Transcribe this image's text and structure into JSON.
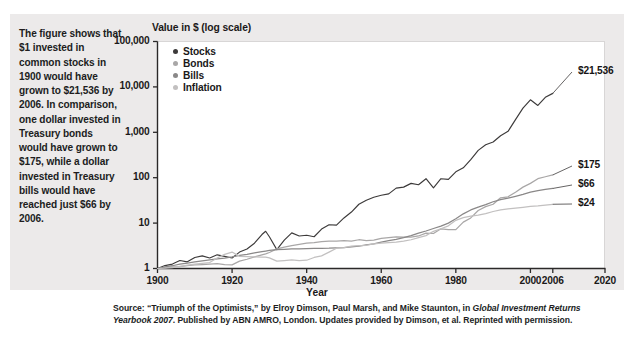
{
  "caption": "The figure shows that $1 invested in common stocks in 1900 would have grown to $21,536 by 2006. In comparison, one dollar invested in Treasury bonds would have grown to $175, while a dollar invested in Treasury bills would have reached just $66 by 2006.",
  "source": {
    "part1": "Source: “Triumph of the Optimists,” by Elroy Dimson, Paul Marsh, and Mike Staunton, in ",
    "italic1": "Global Investment Returns Yearbook 2007",
    "part2": ". Published by ABN AMRO, London. Updates provided by Dimson, et al. Reprinted with permission."
  },
  "chart_data": {
    "type": "line",
    "title": "",
    "ylabel": "Value in $ (log scale)",
    "xlabel": "Year",
    "yscale": "log",
    "ylim": [
      1,
      100000
    ],
    "xlim": [
      1900,
      2020
    ],
    "grid": false,
    "legend_position": "top-left inside plot",
    "ytick_labels": [
      "100,000",
      "10,000",
      "1,000",
      "100",
      "10",
      "1"
    ],
    "ytick_values": [
      100000,
      10000,
      1000,
      100,
      10,
      1
    ],
    "xtick_labels": [
      "1900",
      "1920",
      "1940",
      "1960",
      "1980",
      "2000",
      "2006",
      "2020"
    ],
    "xtick_values": [
      1900,
      1920,
      1940,
      1960,
      1980,
      2000,
      2006,
      2020
    ],
    "legend": [
      "Stocks",
      "Bonds",
      "Bills",
      "Inflation"
    ],
    "colors": {
      "stocks": "#3c3a3a",
      "bonds": "#a9a7a7",
      "bills": "#8a8888",
      "inflation": "#c2c0c0"
    },
    "end_labels": [
      {
        "series": "Stocks",
        "text": "$21,536",
        "value": 21536,
        "year": 2006
      },
      {
        "series": "Bonds",
        "text": "$175",
        "value": 175,
        "year": 2006
      },
      {
        "series": "Bills",
        "text": "$66",
        "value": 66,
        "year": 2006
      },
      {
        "series": "Inflation",
        "text": "$24",
        "value": 24,
        "year": 2006
      }
    ],
    "x": [
      1900,
      1902,
      1904,
      1906,
      1908,
      1910,
      1912,
      1914,
      1916,
      1918,
      1920,
      1922,
      1924,
      1926,
      1928,
      1929,
      1930,
      1932,
      1934,
      1936,
      1938,
      1940,
      1942,
      1944,
      1946,
      1948,
      1950,
      1952,
      1954,
      1956,
      1958,
      1960,
      1962,
      1964,
      1966,
      1968,
      1970,
      1972,
      1974,
      1976,
      1978,
      1980,
      1982,
      1984,
      1986,
      1988,
      1990,
      1992,
      1994,
      1996,
      1998,
      2000,
      2002,
      2004,
      2006
    ],
    "series": [
      {
        "name": "Stocks",
        "color": "#3c3a3a",
        "values": [
          1,
          1.16,
          1.25,
          1.5,
          1.4,
          1.75,
          1.9,
          1.7,
          2.0,
          1.85,
          1.7,
          2.3,
          2.7,
          3.6,
          5.6,
          6.6,
          5.0,
          2.6,
          4.2,
          6.1,
          5.2,
          5.4,
          5.0,
          7.4,
          9.2,
          9.0,
          13.0,
          17.5,
          26.0,
          32.0,
          37.0,
          41.0,
          44.0,
          59.0,
          62.0,
          75.0,
          70.0,
          95.0,
          60.0,
          95.0,
          92.0,
          135.0,
          165.0,
          250.0,
          400.0,
          530.0,
          610.0,
          840.0,
          1050.0,
          1900.0,
          3400.0,
          5200.0,
          3900.0,
          5900.0,
          7200.0
        ]
      },
      {
        "name": "Bonds",
        "color": "#a9a7a7",
        "values": [
          1,
          1.05,
          1.08,
          1.1,
          1.15,
          1.2,
          1.22,
          1.25,
          1.28,
          1.22,
          1.2,
          1.45,
          1.6,
          1.8,
          2.0,
          2.1,
          2.25,
          2.7,
          2.95,
          3.2,
          3.4,
          3.6,
          3.7,
          3.9,
          4.0,
          4.0,
          4.1,
          4.0,
          4.3,
          4.1,
          4.2,
          4.6,
          4.8,
          5.0,
          4.9,
          4.9,
          5.2,
          6.0,
          5.9,
          7.5,
          7.2,
          7.2,
          10.5,
          13.0,
          19.0,
          23.0,
          26.0,
          36.0,
          38.0,
          48.0,
          62.0,
          75.0,
          95.0,
          105.0,
          115.0
        ]
      },
      {
        "name": "Bills",
        "color": "#8a8888",
        "values": [
          1,
          1.08,
          1.15,
          1.25,
          1.32,
          1.4,
          1.48,
          1.55,
          1.62,
          1.7,
          1.8,
          1.95,
          2.05,
          2.2,
          2.35,
          2.42,
          2.5,
          2.6,
          2.65,
          2.7,
          2.72,
          2.74,
          2.76,
          2.78,
          2.8,
          2.85,
          2.9,
          3.0,
          3.1,
          3.3,
          3.5,
          3.8,
          4.1,
          4.4,
          4.8,
          5.3,
          6.0,
          6.7,
          7.6,
          8.6,
          10.0,
          12.5,
          16.0,
          19.5,
          22.5,
          25.5,
          29.5,
          33.0,
          35.5,
          39.0,
          43.0,
          48.0,
          52.0,
          55.0,
          58.0
        ]
      },
      {
        "name": "Inflation",
        "color": "#c2c0c0",
        "values": [
          1,
          1.02,
          1.05,
          1.12,
          1.18,
          1.25,
          1.3,
          1.35,
          1.7,
          2.05,
          2.3,
          1.85,
          1.82,
          1.8,
          1.78,
          1.78,
          1.72,
          1.45,
          1.5,
          1.55,
          1.5,
          1.52,
          1.75,
          1.9,
          2.3,
          2.8,
          2.9,
          3.1,
          3.2,
          3.25,
          3.5,
          3.6,
          3.7,
          3.8,
          4.0,
          4.3,
          4.8,
          5.3,
          6.6,
          7.5,
          8.7,
          11.5,
          13.2,
          14.2,
          15.0,
          16.2,
          18.0,
          19.5,
          20.5,
          21.5,
          22.3,
          23.3,
          24.0,
          25.0,
          26.0
        ]
      }
    ]
  }
}
